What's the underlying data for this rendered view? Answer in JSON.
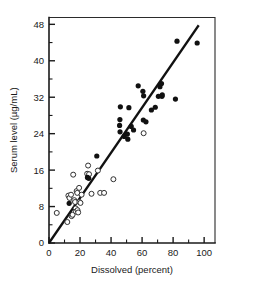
{
  "chart_data": {
    "type": "scatter",
    "title": "",
    "xlabel": "Dissolved (percent)",
    "ylabel": "Serum level (µg/mL)",
    "xlim": [
      0,
      107
    ],
    "ylim": [
      0,
      49.5
    ],
    "xticks": [
      0,
      20,
      40,
      60,
      80,
      100
    ],
    "xticklabels": [
      "0",
      "20",
      "40",
      "60",
      "80",
      "100"
    ],
    "xminorticks": [
      10,
      30,
      50,
      70,
      90
    ],
    "yticks": [
      0,
      8,
      16,
      24,
      32,
      40,
      48
    ],
    "yticklabels": [
      "0",
      "8",
      "16",
      "24",
      "32",
      "40",
      "48"
    ],
    "yminorticks": [
      4,
      12,
      20,
      28,
      36,
      44
    ],
    "grid": false,
    "legend": false,
    "series": [
      {
        "name": "open-circles",
        "marker": "open-circle",
        "points": [
          [
            5.0,
            6.6
          ],
          [
            11.8,
            4.6
          ],
          [
            12.5,
            10.4
          ],
          [
            13.2,
            9.9
          ],
          [
            14.2,
            10.6
          ],
          [
            14.6,
            5.9
          ],
          [
            15.2,
            6.2
          ],
          [
            15.6,
            15.0
          ],
          [
            16.3,
            9.4
          ],
          [
            16.8,
            9.0
          ],
          [
            17.2,
            7.6
          ],
          [
            17.4,
            6.9
          ],
          [
            17.8,
            11.4
          ],
          [
            18.2,
            11.0
          ],
          [
            18.4,
            7.2
          ],
          [
            18.8,
            6.7
          ],
          [
            19.4,
            12.1
          ],
          [
            19.6,
            9.0
          ],
          [
            20.3,
            8.8
          ],
          [
            21.0,
            10.6
          ],
          [
            24.6,
            15.2
          ],
          [
            25.2,
            17.0
          ],
          [
            25.8,
            15.1
          ],
          [
            27.4,
            10.8
          ],
          [
            31.5,
            15.9
          ],
          [
            33.0,
            11.0
          ],
          [
            35.5,
            11.0
          ],
          [
            41.5,
            14.0
          ],
          [
            61.0,
            24.1
          ]
        ]
      },
      {
        "name": "filled-circles",
        "marker": "filled-circle",
        "points": [
          [
            13.0,
            8.7
          ],
          [
            24.8,
            14.4
          ],
          [
            25.6,
            14.2
          ],
          [
            30.8,
            19.1
          ],
          [
            45.5,
            25.8
          ],
          [
            45.7,
            27.1
          ],
          [
            45.8,
            24.4
          ],
          [
            46.0,
            29.9
          ],
          [
            48.5,
            23.4
          ],
          [
            50.5,
            23.9
          ],
          [
            50.8,
            22.8
          ],
          [
            51.5,
            29.7
          ],
          [
            53.0,
            25.6
          ],
          [
            54.5,
            24.8
          ],
          [
            57.5,
            34.5
          ],
          [
            60.5,
            33.3
          ],
          [
            60.8,
            27.0
          ],
          [
            61.0,
            32.3
          ],
          [
            62.5,
            26.6
          ],
          [
            66.0,
            29.2
          ],
          [
            68.5,
            29.8
          ],
          [
            70.5,
            32.2
          ],
          [
            71.5,
            34.3
          ],
          [
            72.5,
            35.0
          ],
          [
            72.8,
            32.2
          ],
          [
            73.0,
            32.5
          ],
          [
            81.5,
            31.6
          ],
          [
            82.5,
            44.3
          ],
          [
            95.5,
            43.9
          ]
        ]
      }
    ],
    "fit_line": {
      "name": "regression-line",
      "x_start": 0.0,
      "y_start": 0.0,
      "x_end": 96.5,
      "y_end": 47.8
    }
  }
}
